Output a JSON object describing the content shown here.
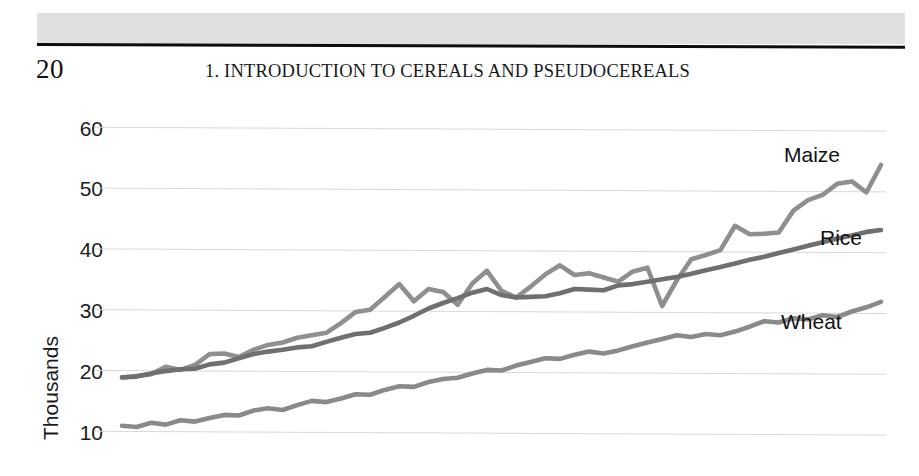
{
  "page": {
    "number": "20",
    "running_head": "1. INTRODUCTION TO CEREALS AND PSEUDOCEREALS"
  },
  "chart_data": {
    "type": "line",
    "title": "",
    "subtitle": "",
    "xlabel": "",
    "ylabel": "Thousands",
    "ylim": [
      10,
      60
    ],
    "yticks": [
      60,
      50,
      40,
      30,
      20,
      10
    ],
    "ytick_labels": [
      "60",
      "50",
      "40",
      "30",
      "20",
      "10"
    ],
    "grid": true,
    "grid_color": "#d8d8d8",
    "legend_position": "line-end-labels",
    "x_axis_visible": false,
    "x_tick_labels": [],
    "x_count": 53,
    "series": [
      {
        "name": "Maize",
        "label": "Maize",
        "color": "#8f8f8f",
        "values": [
          19.0,
          19.3,
          19.6,
          20.8,
          20.3,
          21.1,
          22.9,
          23.0,
          22.4,
          23.6,
          24.4,
          24.8,
          25.6,
          26.0,
          26.4,
          28.0,
          29.8,
          30.2,
          32.3,
          34.4,
          31.6,
          33.6,
          33.1,
          31.0,
          34.5,
          36.6,
          33.3,
          32.2,
          34.0,
          36.0,
          37.5,
          35.9,
          36.2,
          35.5,
          34.8,
          36.5,
          37.1,
          30.8,
          35.0,
          38.5,
          39.2,
          40.0,
          44.0,
          42.6,
          42.7,
          42.9,
          46.5,
          48.2,
          49.1,
          50.9,
          51.3,
          49.5,
          54.0
        ]
      },
      {
        "name": "Rice",
        "label": "Rice",
        "color": "#6f6f6f",
        "values": [
          19.1,
          19.2,
          19.7,
          20.1,
          20.4,
          20.5,
          21.2,
          21.5,
          22.2,
          22.9,
          23.3,
          23.6,
          24.0,
          24.2,
          24.9,
          25.6,
          26.2,
          26.4,
          27.2,
          28.1,
          29.2,
          30.4,
          31.3,
          32.1,
          33.0,
          33.6,
          32.6,
          32.2,
          32.3,
          32.4,
          32.9,
          33.6,
          33.5,
          33.4,
          34.2,
          34.4,
          34.8,
          35.2,
          35.6,
          36.1,
          36.7,
          37.2,
          37.8,
          38.4,
          38.9,
          39.5,
          40.1,
          40.7,
          41.3,
          41.9,
          42.4,
          43.0,
          43.3
        ]
      },
      {
        "name": "Wheat",
        "label": "Wheat",
        "color": "#8a8a8a",
        "values": [
          11.1,
          10.9,
          11.6,
          11.3,
          12.0,
          11.8,
          12.4,
          12.9,
          12.8,
          13.6,
          14.0,
          13.7,
          14.5,
          15.2,
          15.0,
          15.6,
          16.3,
          16.2,
          17.0,
          17.6,
          17.5,
          18.3,
          18.8,
          19.0,
          19.7,
          20.3,
          20.2,
          21.0,
          21.6,
          22.2,
          22.1,
          22.8,
          23.3,
          23.0,
          23.5,
          24.2,
          24.8,
          25.4,
          26.0,
          25.7,
          26.2,
          26.0,
          26.6,
          27.4,
          28.3,
          28.1,
          28.8,
          28.6,
          29.3,
          29.0,
          29.9,
          30.6,
          31.5
        ]
      }
    ]
  }
}
